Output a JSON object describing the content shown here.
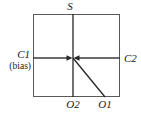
{
  "figure": {
    "type": "schematic-diagram",
    "stroke_color": "#262626",
    "box_stroke_color": "#555555",
    "background_color": "#ffffff"
  },
  "labels": {
    "top": "S",
    "left_primary": "C1",
    "left_secondary": "(bias)",
    "right": "C2",
    "bottom_left": "O2",
    "bottom_right": "O1"
  },
  "geometry": {
    "box": {
      "x": 33,
      "y": 14,
      "width": 87,
      "height": 83
    },
    "center": {
      "x": 73,
      "y": 58
    },
    "vertical_line": {
      "x": 73,
      "y_top": 14,
      "y_bottom": 97
    },
    "horizontal_line": {
      "y": 58,
      "x_left": 33,
      "x_right": 120
    },
    "diagonal_line": {
      "x1": 73,
      "y1": 58,
      "x2": 105,
      "y2": 97
    },
    "arrow_left_to_center": {
      "from_x": 33,
      "to_x": 70,
      "y": 58,
      "direction": "right"
    },
    "arrow_right_to_center": {
      "from_x": 120,
      "to_x": 76,
      "y": 58,
      "direction": "left"
    }
  }
}
